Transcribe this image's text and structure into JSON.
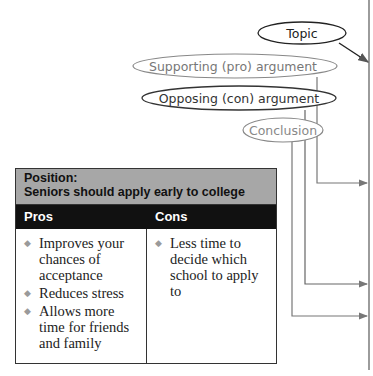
{
  "diagram": {
    "topic": "Topic",
    "supporting": "Supporting (pro) argument",
    "opposing": "Opposing (con) argument",
    "conclusion": "Conclusion"
  },
  "table": {
    "position_label": "Position:",
    "position_text": "Seniors should apply early to college",
    "columns": [
      "Pros",
      "Cons"
    ],
    "pros": [
      "Improves your chances of acceptance",
      "Reduces stress",
      "Allows more time for friends and family"
    ],
    "cons": [
      "Less time to decide which school to apply to"
    ]
  },
  "colors": {
    "header_grey": "#a7a7a7",
    "header_black": "#111111",
    "line_grey": "#777777"
  }
}
